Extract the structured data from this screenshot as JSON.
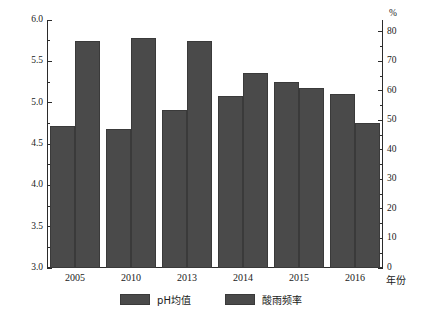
{
  "chart_data": {
    "type": "bar",
    "title": "",
    "subtitle": "",
    "categories": [
      "2005",
      "2010",
      "2013",
      "2014",
      "2015",
      "2016"
    ],
    "xlabel": "年份",
    "ylabel_left": "",
    "ylabel_right": "%",
    "ylim_left": [
      3.0,
      6.0
    ],
    "ylim_right": [
      0,
      80
    ],
    "ytick_labels_left": [
      "3.0",
      "3.5",
      "4.0",
      "4.5",
      "5.0",
      "5.5",
      "6.0"
    ],
    "ytick_values_left": [
      3.0,
      3.5,
      4.0,
      4.5,
      5.0,
      5.5,
      6.0
    ],
    "ytick_labels_right": [
      "0",
      "10",
      "20",
      "30",
      "40",
      "50",
      "60",
      "70",
      "80"
    ],
    "ytick_values_right": [
      0,
      10,
      20,
      30,
      40,
      50,
      60,
      70,
      80
    ],
    "minor_ticks": true,
    "grid": false,
    "legend_position": "bottom",
    "series": [
      {
        "name": "pH均值",
        "axis": "left",
        "color": "#4a4a4a",
        "values": [
          4.72,
          4.68,
          4.91,
          5.08,
          5.25,
          5.1
        ]
      },
      {
        "name": "酸雨频率",
        "axis": "right",
        "color": "#4a4a4a",
        "values": [
          77,
          78,
          77,
          66,
          61,
          49
        ]
      }
    ]
  },
  "legend": {
    "items": [
      {
        "label": "pH均值",
        "color": "#4a4a4a"
      },
      {
        "label": "酸雨频率",
        "color": "#4a4a4a"
      }
    ]
  },
  "axes": {
    "right_unit": "%",
    "x_axis_title": "年份"
  }
}
